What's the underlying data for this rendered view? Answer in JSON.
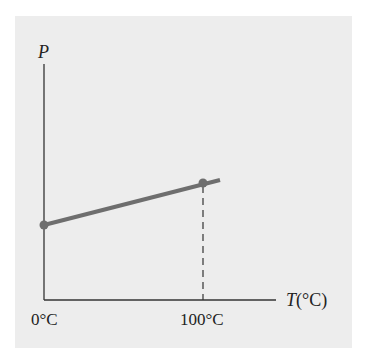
{
  "diagram": {
    "y_axis_label": "P",
    "x_axis_label_var": "T",
    "x_axis_label_unit": "(°C)",
    "x_ticks": [
      {
        "label": "0°C",
        "value": 0
      },
      {
        "label": "100°C",
        "value": 100
      }
    ],
    "line_color": "#6e6e6e",
    "point_color": "#6e6e6e",
    "axis_color": "#333333",
    "background_color": "#ededed",
    "points": [
      {
        "T": 0,
        "desc": "P at 0°C"
      },
      {
        "T": 100,
        "desc": "P at 100°C"
      }
    ],
    "dashed_guide": "vertical dashed line from 100°C point to T axis"
  }
}
